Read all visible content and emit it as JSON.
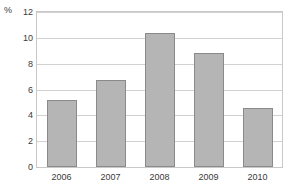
{
  "chart_data": {
    "type": "bar",
    "title": "",
    "subtitle": "",
    "xlabel": "",
    "ylabel": "%",
    "unit_label": "%",
    "categories": [
      "2006",
      "2007",
      "2008",
      "2009",
      "2010"
    ],
    "values": [
      5.2,
      6.7,
      10.4,
      8.8,
      4.6
    ],
    "ylim": [
      0,
      12
    ],
    "ytick_values": [
      0,
      2,
      4,
      6,
      8,
      10,
      12
    ],
    "ytick_labels": [
      "0",
      "2",
      "4",
      "6",
      "8",
      "10",
      "12"
    ],
    "grid": true,
    "grid_axis": "y",
    "legend": false,
    "legend_position": "none",
    "bar_fill_color": "#b5b5b5",
    "bar_edge_color": "#8a8a8a",
    "gridline_color": "#d2d2d2",
    "frame_color": "#c8c8c8",
    "background_color": "#ffffff",
    "text_color": "#3a3a3a"
  }
}
